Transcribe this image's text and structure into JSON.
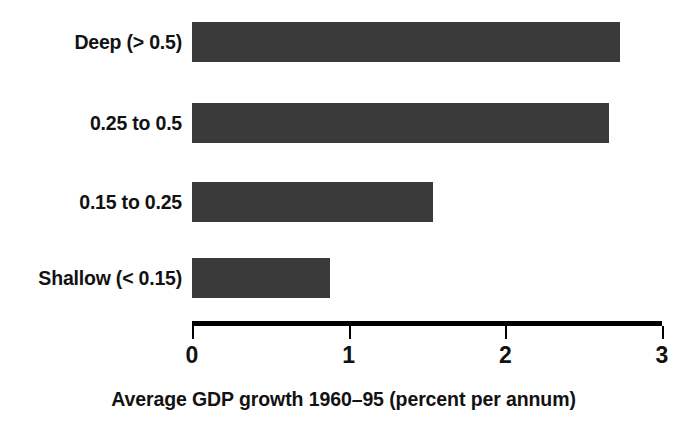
{
  "chart_data": {
    "type": "bar",
    "orientation": "horizontal",
    "title": "",
    "subtitle": "",
    "xlabel": "Average GDP growth 1960–95 (percent per annum)",
    "ylabel": "",
    "categories": [
      "Deep (> 0.5)",
      "0.25 to 0.5",
      "0.15 to 0.25",
      "Shallow (< 0.15)"
    ],
    "values": [
      2.73,
      2.66,
      1.54,
      0.88
    ],
    "xlim": [
      0,
      3
    ],
    "xticks": [
      0,
      1,
      2,
      3
    ],
    "xtick_labels": [
      "0",
      "1",
      "2",
      "3"
    ],
    "grid": false,
    "legend": null,
    "bar_color": "#3a3a3a",
    "background_color": "#ffffff",
    "text_color": "#121212",
    "bars": [
      {
        "label": "Deep (> 0.5)",
        "value": 2.73
      },
      {
        "label": "0.25 to 0.5",
        "value": 2.66
      },
      {
        "label": "0.15 to 0.25",
        "value": 1.54
      },
      {
        "label": "Shallow (< 0.15)",
        "value": 0.88
      }
    ]
  },
  "axis": {
    "title": "Average GDP growth 1960–95 (percent per annum)",
    "ticks": [
      {
        "label": "0",
        "value": 0
      },
      {
        "label": "1",
        "value": 1
      },
      {
        "label": "2",
        "value": 2
      },
      {
        "label": "3",
        "value": 3
      }
    ]
  }
}
